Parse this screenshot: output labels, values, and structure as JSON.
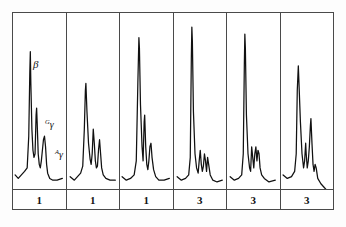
{
  "figure": {
    "frame_color": "#4a4a4a",
    "trace_color": "#111111",
    "background": "#ffffff"
  },
  "annotations": {
    "beta": "β",
    "ggamma_sup": "G",
    "ggamma": "γ",
    "agamma_sup": "A",
    "agamma": "γ"
  },
  "group_labels": [
    {
      "value": "1"
    },
    {
      "value": "1"
    },
    {
      "value": "1"
    },
    {
      "value": "3"
    },
    {
      "value": "3"
    },
    {
      "value": "3"
    }
  ],
  "chart_data": {
    "type": "line",
    "xlabel": "",
    "ylabel": "",
    "grid": false,
    "legend": null,
    "axis_ranges": {
      "x": [
        0,
        100
      ],
      "y": [
        0,
        100
      ]
    },
    "panel_group_labels": [
      "1",
      "1",
      "1",
      "3",
      "3",
      "3"
    ],
    "peak_names": [
      "β",
      "Gγ",
      "Aγ"
    ],
    "panels": [
      {
        "index": 1,
        "group": "1",
        "peaks": [
          {
            "name": "β",
            "x": 33,
            "height": 78,
            "width": 7
          },
          {
            "name": "Gγ",
            "x": 45,
            "height": 42,
            "width": 5
          },
          {
            "name": "Aγ",
            "x": 60,
            "height": 28,
            "width": 6
          }
        ],
        "baseline": 8,
        "path": "M 4,92 L 10,94 L 16,92 L 22,90 L 27,88 L 30,70 L 32,34 L 33,22 L 34,40 L 36,66 L 38,78 L 40,82 L 42,80 L 44,58 L 45,54 L 46,62 L 48,80 L 50,86 L 52,88 L 54,84 L 56,78 L 58,72 L 60,70 L 62,76 L 64,86 L 66,91 L 70,94 L 76,95 L 84,95 L 94,94"
      },
      {
        "index": 2,
        "group": "1",
        "peaks": [
          {
            "name": "β",
            "x": 36,
            "height": 60,
            "width": 7
          },
          {
            "name": "Gγ",
            "x": 50,
            "height": 32,
            "width": 6
          },
          {
            "name": "Aγ",
            "x": 62,
            "height": 26,
            "width": 6
          }
        ],
        "baseline": 8,
        "path": "M 6,93 L 14,95 L 20,93 L 26,91 L 30,87 L 33,66 L 35,44 L 36,40 L 38,56 L 41,74 L 44,83 L 46,86 L 48,80 L 50,66 L 52,74 L 54,84 L 56,88 L 58,87 L 60,78 L 62,72 L 64,80 L 66,88 L 69,92 L 74,94 L 82,95 L 92,95"
      },
      {
        "index": 3,
        "group": "1",
        "peaks": [
          {
            "name": "β",
            "x": 36,
            "height": 86,
            "width": 6
          },
          {
            "name": "Gγ",
            "x": 46,
            "height": 36,
            "width": 5
          },
          {
            "name": "Aγ",
            "x": 58,
            "height": 24,
            "width": 6
          }
        ],
        "baseline": 8,
        "path": "M 4,93 L 12,95 L 20,94 L 27,92 L 31,84 L 34,40 L 36,14 L 37,20 L 39,52 L 42,76 L 44,84 L 46,62 L 47,58 L 49,76 L 51,86 L 53,89 L 55,84 L 57,76 L 59,74 L 61,82 L 64,89 L 68,93 L 74,95 L 84,95 L 94,94"
      },
      {
        "index": 4,
        "group": "3",
        "peaks": [
          {
            "name": "β",
            "x": 34,
            "height": 94,
            "width": 5
          },
          {
            "name": "Gγ",
            "x": 50,
            "height": 22,
            "width": 6
          },
          {
            "name": "Aγ",
            "x": 64,
            "height": 18,
            "width": 6
          }
        ],
        "baseline": 8,
        "path": "M 6,93 L 14,95 L 22,94 L 28,92 L 31,82 L 33,26 L 34,8 L 35,16 L 37,56 L 40,80 L 43,88 L 46,91 L 48,84 L 50,78 L 52,86 L 54,90 L 56,87 L 58,80 L 60,84 L 62,90 L 64,82 L 66,86 L 69,92 L 74,95 L 82,96 L 92,95"
      },
      {
        "index": 5,
        "group": "3",
        "peaks": [
          {
            "name": "β",
            "x": 34,
            "height": 90,
            "width": 5
          },
          {
            "name": "Gγ",
            "x": 48,
            "height": 28,
            "width": 6
          },
          {
            "name": "Aγ",
            "x": 60,
            "height": 26,
            "width": 6
          }
        ],
        "baseline": 8,
        "path": "M 6,93 L 14,95 L 22,94 L 28,92 L 31,80 L 33,30 L 34,12 L 35,20 L 37,58 L 40,80 L 43,88 L 45,90 L 47,76 L 49,82 L 51,88 L 53,80 L 55,76 L 57,84 L 59,78 L 61,80 L 63,88 L 66,92 L 71,94 L 80,96 L 92,95"
      },
      {
        "index": 6,
        "group": "3",
        "peaks": [
          {
            "name": "β",
            "x": 32,
            "height": 72,
            "width": 6
          },
          {
            "name": "Gγ",
            "x": 46,
            "height": 30,
            "width": 5
          },
          {
            "name": "Aγ",
            "x": 58,
            "height": 40,
            "width": 5
          }
        ],
        "baseline": 8,
        "path": "M 4,92 L 12,94 L 20,93 L 26,90 L 29,80 L 31,44 L 33,30 L 34,38 L 37,62 L 40,80 L 43,88 L 45,84 L 47,74 L 48,80 L 50,88 L 52,84 L 54,76 L 56,64 L 57,60 L 59,74 L 61,86 L 63,90 L 65,86 L 67,88 L 70,94 L 76,97 L 82,99 L 88,101"
      }
    ]
  }
}
